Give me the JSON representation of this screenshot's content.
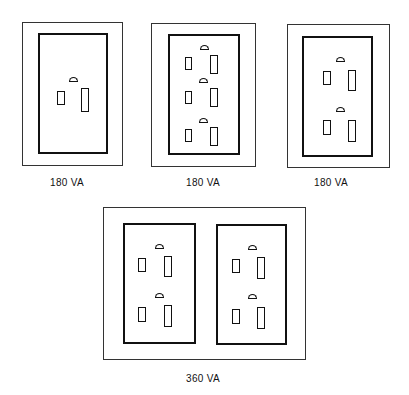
{
  "diagram": {
    "type": "receptacle-load-illustration",
    "items": [
      {
        "id": "single-receptacle",
        "receptacles": 1,
        "label": "180 VA"
      },
      {
        "id": "triplex-receptacle",
        "receptacles": 3,
        "label": "180 VA"
      },
      {
        "id": "duplex-receptacle",
        "receptacles": 2,
        "label": "180 VA"
      },
      {
        "id": "double-duplex-receptacle",
        "receptacles": 4,
        "label": "360 VA"
      }
    ]
  },
  "colors": {
    "line": "#111111",
    "background": "#ffffff"
  }
}
